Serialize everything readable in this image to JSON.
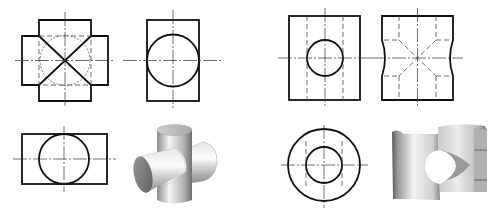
{
  "figure": {
    "colors": {
      "line": "#111111",
      "background": "#ffffff",
      "shade_light": "#f2f2f2",
      "shade_dark": "#6a6a6a"
    },
    "groups": [
      {
        "name": "cross-cylinder-part",
        "views": [
          "front-view",
          "side-view",
          "top-view",
          "isometric-model"
        ],
        "front_view": {
          "features": [
            "cross-shaped outline",
            "diagonal intersection lines",
            "hidden circle",
            "center lines"
          ]
        },
        "side_view": {
          "features": [
            "rectangle",
            "circle",
            "center lines"
          ]
        },
        "top_view": {
          "features": [
            "rectangle",
            "circle",
            "center lines"
          ]
        },
        "model": "two perpendicular solid cylinders intersecting"
      },
      {
        "name": "hollow-cylinder-with-cross-hole",
        "views": [
          "front-view",
          "side-view",
          "top-view",
          "isometric-model"
        ],
        "front_view": {
          "features": [
            "rectangle",
            "circular hole",
            "hidden bore lines",
            "center lines"
          ]
        },
        "side_view": {
          "features": [
            "notched outline",
            "hidden bore lines",
            "hidden intersection diagonals",
            "center lines"
          ]
        },
        "top_view": {
          "features": [
            "outer circle",
            "inner circle",
            "hidden lines",
            "center lines"
          ]
        },
        "model": "cut-away hollow cylinder with transverse hole"
      }
    ]
  }
}
